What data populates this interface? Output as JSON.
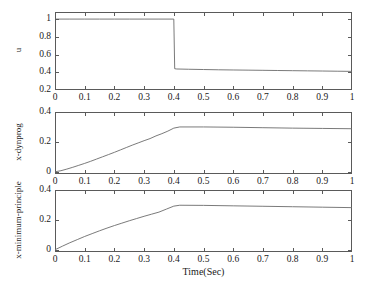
{
  "figure": {
    "background_color": "#ffffff",
    "line_color": "#6b6b6b",
    "axis_color": "#5a5a5a",
    "xlabel": "Time(Sec)",
    "x_ticks": [
      "0",
      "0.1",
      "0.2",
      "0.3",
      "0.4",
      "0.5",
      "0.6",
      "0.7",
      "0.8",
      "0.9",
      "1"
    ]
  },
  "chart_data": [
    {
      "type": "line",
      "title": "",
      "xlabel": "",
      "ylabel": "u",
      "xlim": [
        0,
        1
      ],
      "ylim": [
        0.2,
        1.08
      ],
      "xticks": [
        0,
        0.1,
        0.2,
        0.3,
        0.4,
        0.5,
        0.6,
        0.7,
        0.8,
        0.9,
        1
      ],
      "xticklabels": [
        "0",
        "0.1",
        "0.2",
        "0.3",
        "0.4",
        "0.5",
        "0.6",
        "0.7",
        "0.8",
        "0.9",
        "1"
      ],
      "yticks": [
        0.2,
        0.4,
        0.6,
        0.8,
        1
      ],
      "yticklabels": [
        "0.2",
        "0.4",
        "0.6",
        "0.8",
        "1"
      ],
      "grid": false,
      "legend": null,
      "series": [
        {
          "name": "u",
          "x": [
            0,
            0.05,
            0.1,
            0.15,
            0.2,
            0.25,
            0.3,
            0.35,
            0.4,
            0.403,
            0.41,
            0.45,
            0.5,
            0.55,
            0.6,
            0.65,
            0.7,
            0.75,
            0.8,
            0.85,
            0.9,
            0.95,
            1
          ],
          "y": [
            1,
            1,
            1,
            1,
            1,
            1,
            1,
            1,
            1,
            0.44,
            0.437,
            0.434,
            0.431,
            0.428,
            0.426,
            0.424,
            0.422,
            0.42,
            0.418,
            0.416,
            0.414,
            0.412,
            0.41
          ]
        }
      ]
    },
    {
      "type": "line",
      "title": "",
      "xlabel": "",
      "ylabel": "x-dynprog",
      "xlim": [
        0,
        1
      ],
      "ylim": [
        -0.015,
        0.4
      ],
      "xticks": [
        0,
        0.1,
        0.2,
        0.3,
        0.4,
        0.5,
        0.6,
        0.7,
        0.8,
        0.9,
        1
      ],
      "xticklabels": [
        "0",
        "0.1",
        "0.2",
        "0.3",
        "0.4",
        "0.5",
        "0.6",
        "0.7",
        "0.8",
        "0.9",
        "1"
      ],
      "yticks": [
        0,
        0.2,
        0.4
      ],
      "yticklabels": [
        "0",
        "0.2",
        "0.4"
      ],
      "grid": false,
      "legend": null,
      "note": "staircase quantized ramp rising to plateau then slow decay",
      "series": [
        {
          "name": "x-dynprog",
          "x": [
            0,
            0.02,
            0.04,
            0.06,
            0.08,
            0.1,
            0.12,
            0.14,
            0.16,
            0.18,
            0.2,
            0.22,
            0.24,
            0.26,
            0.28,
            0.3,
            0.32,
            0.34,
            0.36,
            0.38,
            0.4,
            0.42,
            0.5,
            0.6,
            0.7,
            0.8,
            0.9,
            1
          ],
          "y": [
            0,
            0.007,
            0.018,
            0.03,
            0.043,
            0.056,
            0.07,
            0.085,
            0.1,
            0.115,
            0.13,
            0.146,
            0.162,
            0.178,
            0.193,
            0.208,
            0.222,
            0.24,
            0.255,
            0.272,
            0.292,
            0.3,
            0.3,
            0.298,
            0.295,
            0.292,
            0.29,
            0.288
          ]
        }
      ]
    },
    {
      "type": "line",
      "title": "",
      "xlabel": "Time(Sec)",
      "ylabel": "x-minimum-principle",
      "xlim": [
        0,
        1
      ],
      "ylim": [
        -0.015,
        0.4
      ],
      "xticks": [
        0,
        0.1,
        0.2,
        0.3,
        0.4,
        0.5,
        0.6,
        0.7,
        0.8,
        0.9,
        1
      ],
      "xticklabels": [
        "0",
        "0.1",
        "0.2",
        "0.3",
        "0.4",
        "0.5",
        "0.6",
        "0.7",
        "0.8",
        "0.9",
        "1"
      ],
      "yticks": [
        0,
        0.2,
        0.4
      ],
      "yticklabels": [
        "0",
        "0.2",
        "0.4"
      ],
      "grid": false,
      "legend": null,
      "note": "smooth concave ramp rising to plateau then slow decay",
      "series": [
        {
          "name": "x-minimum-principle",
          "x": [
            0,
            0.025,
            0.05,
            0.075,
            0.1,
            0.125,
            0.15,
            0.175,
            0.2,
            0.225,
            0.25,
            0.275,
            0.3,
            0.325,
            0.35,
            0.375,
            0.4,
            0.42,
            0.5,
            0.6,
            0.7,
            0.8,
            0.9,
            1
          ],
          "y": [
            0,
            0.024,
            0.047,
            0.068,
            0.089,
            0.108,
            0.127,
            0.145,
            0.162,
            0.178,
            0.194,
            0.209,
            0.224,
            0.238,
            0.252,
            0.272,
            0.292,
            0.298,
            0.297,
            0.294,
            0.291,
            0.288,
            0.285,
            0.282
          ]
        }
      ]
    }
  ]
}
